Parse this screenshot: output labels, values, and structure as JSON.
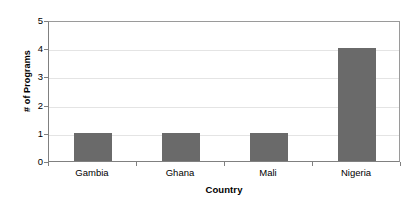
{
  "chart_data": {
    "type": "bar",
    "title": "",
    "subtitle": "",
    "xlabel": "Country",
    "ylabel": "# of Programs",
    "categories": [
      "Gambia",
      "Ghana",
      "Mali",
      "Nigeria"
    ],
    "values": [
      1,
      1,
      1,
      4
    ],
    "ylim": [
      0,
      5
    ],
    "yticks": [
      0,
      1,
      2,
      3,
      4,
      5
    ],
    "ytick_labels": [
      "0",
      "1",
      "2",
      "3",
      "4",
      "5"
    ],
    "grid": true,
    "grid_axis": "y",
    "legend": false,
    "legend_position": "none",
    "bar_color": "#6a6a6a",
    "plot_background": "#ffffff",
    "gridline_color": "#e4e4e4",
    "axis_color": "#808080"
  }
}
